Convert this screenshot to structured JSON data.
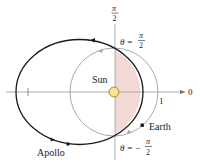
{
  "figure": {
    "labels": {
      "sun": "Sun",
      "earth": "Earth",
      "apollo": "Apollo",
      "axis_zero": "0",
      "axis_one": "1",
      "top_pi": "π",
      "top_two": "2",
      "theta_top_lhs": "θ =",
      "theta_top_num": "π",
      "theta_top_den": "2",
      "theta_bot_lhs": "θ = −",
      "theta_bot_num": "π",
      "theta_bot_den": "2"
    },
    "colors": {
      "apollo_orbit": "#1a1a1a",
      "earth_orbit": "#a8a8a8",
      "axis": "#9a9a9a",
      "shade": "#f3d9d6",
      "sun_fill": "#f6e58a",
      "sun_stroke": "#8a7a30"
    }
  }
}
